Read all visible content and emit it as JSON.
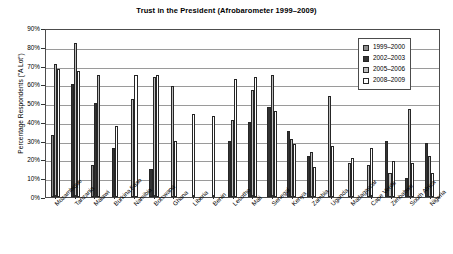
{
  "chart_data": {
    "type": "bar",
    "title": "Trust in the President (Afrobarometer 1999–2009)",
    "xlabel": "",
    "ylabel": "Percentage Respondents (\"A Lot\")",
    "ylim": [
      0,
      90
    ],
    "ytick_labels": [
      "0%",
      "10%",
      "20%",
      "30%",
      "40%",
      "50%",
      "60%",
      "70%",
      "80%",
      "90%"
    ],
    "ytick_values": [
      0,
      10,
      20,
      30,
      40,
      50,
      60,
      70,
      80,
      90
    ],
    "grid": true,
    "legend_position": "top-right",
    "categories": [
      "Mozambique",
      "Tanzania",
      "Malawi",
      "Burkina Faso",
      "Namibia",
      "Botswana",
      "Ghana",
      "Liberia",
      "Benin",
      "Lesotho",
      "Mali",
      "Senegal",
      "Kenya",
      "Zambia",
      "Uganda",
      "Madagascar",
      "Cape Verde",
      "Zimbabwe",
      "South Africa",
      "Nigeria"
    ],
    "series": [
      {
        "name": "1999–2000",
        "color": "#8d8d8d",
        "values": [
          33,
          null,
          17,
          null,
          null,
          null,
          null,
          null,
          null,
          null,
          null,
          null,
          null,
          null,
          null,
          null,
          null,
          null,
          null,
          null
        ]
      },
      {
        "name": "2002–2003",
        "color": "#333333",
        "values": [
          null,
          60,
          50,
          26,
          null,
          15,
          null,
          null,
          null,
          30,
          40,
          48,
          35,
          22,
          null,
          null,
          null,
          30,
          10,
          29
        ]
      },
      {
        "name": "2005–2006",
        "color": "#bdbdbd",
        "values": [
          71,
          82,
          65,
          null,
          52,
          64,
          59,
          null,
          null,
          41,
          57,
          65,
          31,
          24,
          54,
          18,
          17,
          13,
          47,
          22
        ]
      },
      {
        "name": "2008–2009",
        "color": "#ffffff",
        "values": [
          68,
          67,
          null,
          38,
          65,
          65,
          30,
          44,
          43,
          63,
          64,
          46,
          28,
          16,
          27,
          21,
          26,
          19,
          18,
          13
        ]
      }
    ]
  },
  "legend": {
    "items": [
      {
        "label": "1999–2000"
      },
      {
        "label": "2002–2003"
      },
      {
        "label": "2005–2006"
      },
      {
        "label": "2008–2009"
      }
    ]
  }
}
